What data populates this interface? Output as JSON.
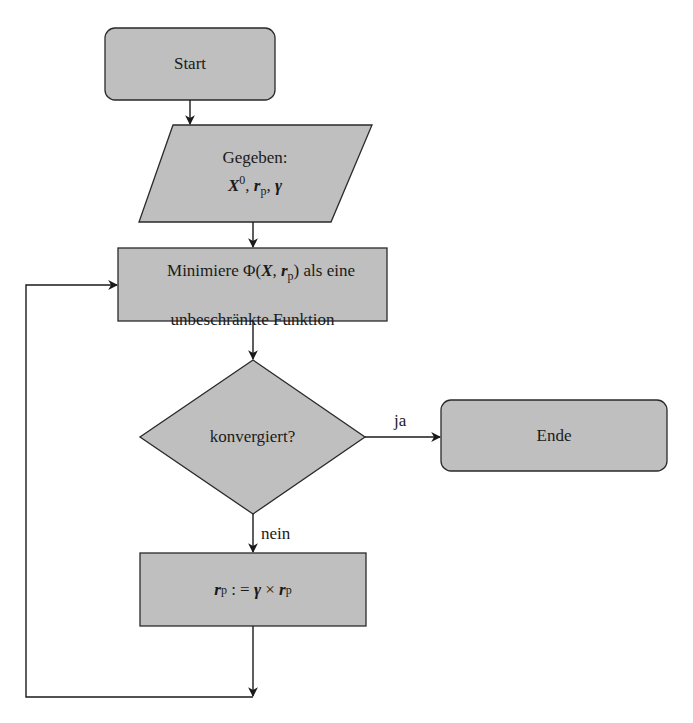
{
  "diagram": {
    "type": "flowchart",
    "colors": {
      "node_fill": "#bfbfbf",
      "stroke": "#2a2a2a",
      "background": "#ffffff"
    },
    "nodes": {
      "start": {
        "shape": "rounded-rect",
        "label": "Start"
      },
      "input": {
        "shape": "parallelogram",
        "line1": "Gegeben:",
        "line2_parts": {
          "x": "X",
          "x_sup": "0",
          "sep1": ", ",
          "r": "r",
          "r_sub": "p",
          "sep2": ", ",
          "gamma": "γ"
        }
      },
      "minimize": {
        "shape": "rect",
        "line1_prefix": "Minimiere Φ(",
        "line1_x": "X",
        "line1_comma": ", ",
        "line1_r": "r",
        "line1_r_sub": "p",
        "line1_suffix": ") als eine",
        "line2": "unbeschränkte Funktion"
      },
      "decision": {
        "shape": "diamond",
        "label": "konvergiert?"
      },
      "end": {
        "shape": "rounded-rect",
        "label": "Ende"
      },
      "update": {
        "shape": "rect",
        "lhs_r": "r",
        "lhs_sub": "p",
        "assign": " : = ",
        "gamma": "γ",
        "times": " × ",
        "rhs_r": "r",
        "rhs_sub": "p"
      }
    },
    "edges": [
      {
        "from": "start",
        "to": "input",
        "label": ""
      },
      {
        "from": "input",
        "to": "minimize",
        "label": ""
      },
      {
        "from": "minimize",
        "to": "decision",
        "label": ""
      },
      {
        "from": "decision",
        "to": "end",
        "label": "ja"
      },
      {
        "from": "decision",
        "to": "update",
        "label": "nein"
      },
      {
        "from": "update",
        "to": "minimize",
        "label": ""
      }
    ],
    "edge_labels": {
      "yes": "ja",
      "no": "nein"
    }
  }
}
